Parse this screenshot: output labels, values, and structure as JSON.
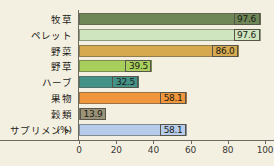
{
  "chart_data": {
    "type": "bar",
    "orientation": "horizontal",
    "title": "",
    "xlabel": "(%)",
    "ylabel": "",
    "xlim": [
      0,
      100
    ],
    "xticks": [
      "0",
      "20",
      "40",
      "60",
      "80",
      "100"
    ],
    "grid": false,
    "legend": "none",
    "categories": [
      "牧草",
      "ペレット",
      "野菜",
      "野草",
      "ハーブ",
      "果物",
      "穀類",
      "サプリメント"
    ],
    "values": [
      97.6,
      97.6,
      86.0,
      39.5,
      32.5,
      58.1,
      13.9,
      58.1
    ],
    "value_labels": [
      "97.6",
      "97.6",
      "86.0",
      "39.5",
      "32.5",
      "58.1",
      "13.9",
      "58.1"
    ],
    "bar_colors": [
      "#6f8657",
      "#cfe5c0",
      "#d6a94f",
      "#a8cf5c",
      "#449389",
      "#f0963c",
      "#9a9378",
      "#b6ccea"
    ],
    "value_box_colors": [
      "#6f8657",
      "#cfe5c0",
      "#d6a94f",
      "#a8cf5c",
      "#449389",
      "#f0963c",
      "#9a9378",
      "#b6ccea"
    ],
    "background": "#f3f0e1",
    "axis_color": "#6b6a60"
  },
  "axis": {
    "unit_label": "(%)"
  }
}
